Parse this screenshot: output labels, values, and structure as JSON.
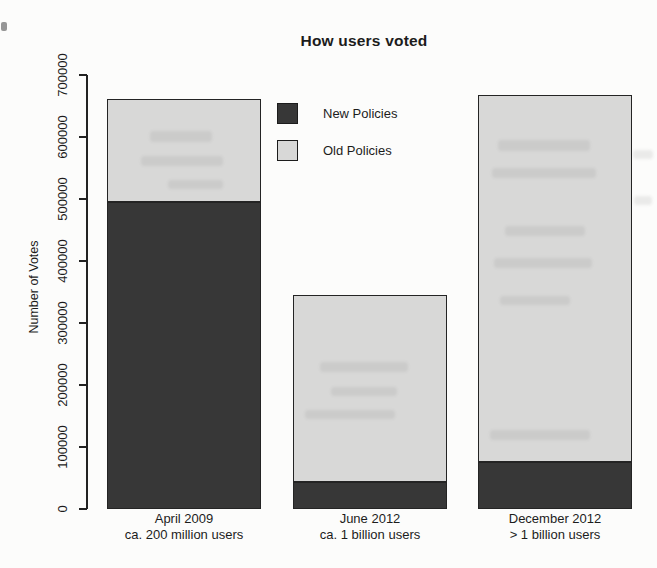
{
  "chart_data": {
    "type": "bar",
    "stacked": true,
    "title": "How users voted",
    "xlabel": "",
    "ylabel": "Number of Votes",
    "ylim": [
      0,
      700000
    ],
    "yticks": [
      0,
      100000,
      200000,
      300000,
      400000,
      500000,
      600000,
      700000
    ],
    "categories": [
      "April 2009",
      "June 2012",
      "December 2012"
    ],
    "category_sublabels": [
      "ca. 200 million users",
      "ca. 1 billion users",
      "> 1 billion users"
    ],
    "series": [
      {
        "name": "New Policies",
        "color": "#373737",
        "values": [
          495000,
          42000,
          75000
        ]
      },
      {
        "name": "Old Policies",
        "color": "#d8d8d7",
        "values": [
          167000,
          302000,
          593000
        ]
      }
    ],
    "totals": [
      662000,
      344000,
      668000
    ],
    "grid": false,
    "legend_position": "inside-top-left",
    "bar_border_color": "#242424",
    "axis_color": "#222222"
  }
}
